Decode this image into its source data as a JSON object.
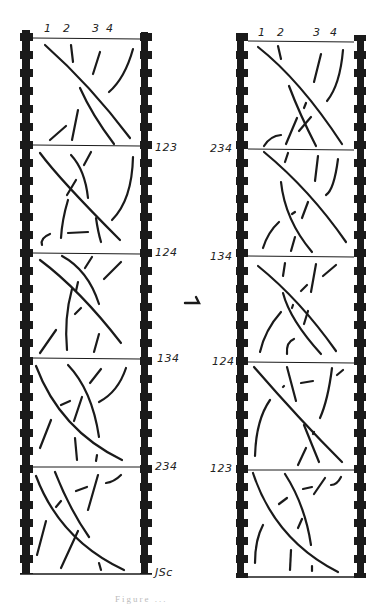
{
  "figure": {
    "caption_partial": "Figure ...",
    "transition_symbol": "⇀",
    "left_strip": {
      "column_labels": [
        "1",
        "2",
        "3",
        "4"
      ],
      "frame_labels": [
        "123",
        "124",
        "134",
        "234",
        "JSc"
      ]
    },
    "right_strip": {
      "column_labels": [
        "1",
        "2",
        "3",
        "4"
      ],
      "frame_labels": [
        "234",
        "134",
        "124",
        "123"
      ]
    },
    "colors": {
      "ink": "#1a1a1a",
      "paper": "#ffffff"
    }
  }
}
